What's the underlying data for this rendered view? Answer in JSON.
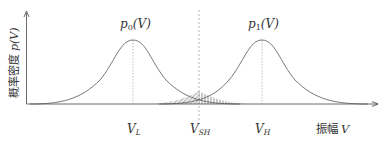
{
  "diagram": {
    "title": "",
    "y_axis_label": "概率密度 p(V)",
    "y_axis_label_cn": "概率密度",
    "y_axis_label_sym": "p(V)",
    "x_axis_label": "振幅 V",
    "x_axis_label_cn": "振幅",
    "x_axis_label_sym": "V",
    "curves": [
      {
        "name": "p0(V)",
        "label_main": "p",
        "label_sub": "0",
        "label_tail": "(V)",
        "center_label": "V",
        "center_sub": "L"
      },
      {
        "name": "p1(V)",
        "label_main": "p",
        "label_sub": "1",
        "label_tail": "(V)",
        "center_label": "V",
        "center_sub": "H"
      }
    ],
    "threshold": {
      "label": "V",
      "sub": "SH"
    },
    "colors": {
      "curve": "#555555",
      "axis": "#444444",
      "dashed": "#888888",
      "hatch": "#666666"
    }
  }
}
